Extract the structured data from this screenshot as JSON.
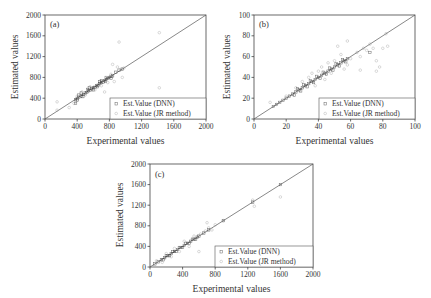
{
  "chart_data": [
    {
      "panel": "(a)",
      "type": "scatter",
      "title": "",
      "xlabel": "Experimental values",
      "ylabel": "Estimated values",
      "xlim": [
        0,
        2000
      ],
      "ylim": [
        0,
        2000
      ],
      "xticks": [
        0,
        400,
        800,
        1200,
        1600,
        2000
      ],
      "yticks": [
        0,
        400,
        800,
        1200,
        1600,
        2000
      ],
      "grid": false,
      "reference_line": "y = x",
      "legend_position": "lower right",
      "series": [
        {
          "name": "Est.Value (DNN)",
          "marker": "open square",
          "color": "#333333",
          "points": [
            [
              380,
              370
            ],
            [
              400,
              390
            ],
            [
              420,
              420
            ],
            [
              450,
              440
            ],
            [
              480,
              470
            ],
            [
              500,
              500
            ],
            [
              520,
              510
            ],
            [
              540,
              540
            ],
            [
              560,
              550
            ],
            [
              580,
              580
            ],
            [
              600,
              600
            ],
            [
              620,
              610
            ],
            [
              640,
              640
            ],
            [
              660,
              650
            ],
            [
              680,
              680
            ],
            [
              700,
              700
            ],
            [
              720,
              710
            ],
            [
              740,
              740
            ],
            [
              760,
              760
            ],
            [
              780,
              780
            ],
            [
              800,
              800
            ],
            [
              820,
              820
            ],
            [
              840,
              830
            ],
            [
              400,
              360
            ],
            [
              450,
              500
            ],
            [
              550,
              600
            ],
            [
              650,
              620
            ],
            [
              700,
              740
            ],
            [
              750,
              720
            ],
            [
              380,
              300
            ],
            [
              420,
              460
            ],
            [
              470,
              430
            ],
            [
              530,
              570
            ],
            [
              600,
              560
            ],
            [
              680,
              720
            ],
            [
              760,
              800
            ],
            [
              820,
              780
            ],
            [
              880,
              900
            ],
            [
              920,
              940
            ],
            [
              960,
              960
            ]
          ]
        },
        {
          "name": "Est.Value (JR method)",
          "marker": "open circle",
          "color": "#999999",
          "points": [
            [
              150,
              330
            ],
            [
              150,
              170
            ],
            [
              300,
              220
            ],
            [
              360,
              300
            ],
            [
              400,
              440
            ],
            [
              460,
              520
            ],
            [
              500,
              460
            ],
            [
              560,
              620
            ],
            [
              620,
              560
            ],
            [
              700,
              640
            ],
            [
              740,
              520
            ],
            [
              780,
              700
            ],
            [
              820,
              860
            ],
            [
              840,
              1050
            ],
            [
              860,
              720
            ],
            [
              900,
              1000
            ],
            [
              920,
              1480
            ],
            [
              940,
              950
            ],
            [
              960,
              800
            ],
            [
              980,
              980
            ],
            [
              1420,
              1660
            ],
            [
              1420,
              600
            ]
          ]
        }
      ]
    },
    {
      "panel": "(b)",
      "type": "scatter",
      "title": "",
      "xlabel": "Experimental values",
      "ylabel": "Estimated values",
      "xlim": [
        0,
        100
      ],
      "ylim": [
        0,
        100
      ],
      "xticks": [
        0,
        20,
        40,
        60,
        80,
        100
      ],
      "yticks": [
        0,
        20,
        40,
        60,
        80,
        100
      ],
      "grid": false,
      "reference_line": "y = x",
      "legend_position": "lower right",
      "series": [
        {
          "name": "Est.Value (DNN)",
          "marker": "open square",
          "color": "#333333",
          "points": [
            [
              12,
              12
            ],
            [
              14,
              14
            ],
            [
              16,
              16
            ],
            [
              18,
              18
            ],
            [
              20,
              20
            ],
            [
              22,
              22
            ],
            [
              24,
              24
            ],
            [
              26,
              26
            ],
            [
              28,
              28
            ],
            [
              30,
              30
            ],
            [
              32,
              32
            ],
            [
              34,
              34
            ],
            [
              36,
              36
            ],
            [
              38,
              38
            ],
            [
              40,
              40
            ],
            [
              42,
              42
            ],
            [
              44,
              44
            ],
            [
              46,
              46
            ],
            [
              48,
              48
            ],
            [
              50,
              50
            ],
            [
              52,
              52
            ],
            [
              54,
              54
            ],
            [
              56,
              56
            ],
            [
              58,
              58
            ],
            [
              25,
              23
            ],
            [
              27,
              29
            ],
            [
              29,
              27
            ],
            [
              31,
              33
            ],
            [
              33,
              31
            ],
            [
              35,
              37
            ],
            [
              37,
              35
            ],
            [
              39,
              41
            ],
            [
              41,
              39
            ],
            [
              43,
              45
            ],
            [
              45,
              43
            ],
            [
              47,
              49
            ],
            [
              49,
              47
            ],
            [
              51,
              53
            ],
            [
              53,
              51
            ],
            [
              55,
              57
            ],
            [
              57,
              55
            ],
            [
              72,
              64
            ]
          ]
        },
        {
          "name": "Est.Value (JR method)",
          "marker": "open circle",
          "color": "#999999",
          "points": [
            [
              10,
              16
            ],
            [
              14,
              14
            ],
            [
              20,
              22
            ],
            [
              26,
              30
            ],
            [
              30,
              36
            ],
            [
              34,
              40
            ],
            [
              36,
              44
            ],
            [
              38,
              32
            ],
            [
              40,
              46
            ],
            [
              42,
              50
            ],
            [
              44,
              38
            ],
            [
              46,
              54
            ],
            [
              48,
              44
            ],
            [
              50,
              56
            ],
            [
              52,
              70
            ],
            [
              54,
              62
            ],
            [
              56,
              48
            ],
            [
              58,
              75
            ],
            [
              58,
              52
            ],
            [
              60,
              58
            ],
            [
              64,
              64
            ],
            [
              66,
              60
            ],
            [
              66,
              47
            ],
            [
              68,
              68
            ],
            [
              70,
              66
            ],
            [
              72,
              72
            ],
            [
              74,
              68
            ],
            [
              76,
              46
            ],
            [
              76,
              56
            ],
            [
              78,
              50
            ],
            [
              80,
              68
            ],
            [
              82,
              82
            ],
            [
              83,
              70
            ]
          ]
        }
      ]
    },
    {
      "panel": "(c)",
      "type": "scatter",
      "title": "",
      "xlabel": "Experimental values",
      "ylabel": "Estimated values",
      "xlim": [
        0,
        2000
      ],
      "ylim": [
        0,
        2000
      ],
      "xticks": [
        0,
        400,
        800,
        1200,
        1600,
        2000
      ],
      "yticks": [
        0,
        400,
        800,
        1200,
        1600,
        2000
      ],
      "grid": false,
      "reference_line": "y = x",
      "legend_position": "lower right",
      "series": [
        {
          "name": "Est.Value (DNN)",
          "marker": "open square",
          "color": "#333333",
          "points": [
            [
              60,
              60
            ],
            [
              100,
              100
            ],
            [
              140,
              140
            ],
            [
              180,
              180
            ],
            [
              220,
              220
            ],
            [
              260,
              260
            ],
            [
              300,
              300
            ],
            [
              340,
              340
            ],
            [
              380,
              380
            ],
            [
              420,
              420
            ],
            [
              460,
              460
            ],
            [
              500,
              500
            ],
            [
              540,
              540
            ],
            [
              580,
              580
            ],
            [
              600,
              600
            ],
            [
              160,
              140
            ],
            [
              200,
              220
            ],
            [
              240,
              220
            ],
            [
              280,
              300
            ],
            [
              320,
              300
            ],
            [
              360,
              380
            ],
            [
              400,
              380
            ],
            [
              440,
              460
            ],
            [
              480,
              460
            ],
            [
              520,
              540
            ],
            [
              560,
              540
            ],
            [
              660,
              660
            ],
            [
              720,
              720
            ],
            [
              900,
              900
            ],
            [
              1260,
              1260
            ],
            [
              1600,
              1600
            ]
          ]
        },
        {
          "name": "Est.Value (JR method)",
          "marker": "open circle",
          "color": "#999999",
          "points": [
            [
              80,
              120
            ],
            [
              150,
              90
            ],
            [
              200,
              260
            ],
            [
              260,
              200
            ],
            [
              300,
              360
            ],
            [
              360,
              300
            ],
            [
              420,
              500
            ],
            [
              480,
              400
            ],
            [
              540,
              600
            ],
            [
              600,
              300
            ],
            [
              620,
              640
            ],
            [
              680,
              700
            ],
            [
              700,
              860
            ],
            [
              720,
              760
            ],
            [
              760,
              720
            ],
            [
              800,
              820
            ],
            [
              900,
              900
            ],
            [
              1260,
              1300
            ],
            [
              1280,
              1180
            ],
            [
              1600,
              1360
            ]
          ]
        }
      ]
    }
  ],
  "panels": [
    {
      "label": "(a)",
      "xlabel": "Experimental values",
      "ylabel": "Estimated values",
      "xtick_labels": [
        "0",
        "400",
        "800",
        "1200",
        "1600",
        "2000"
      ],
      "ytick_labels": [
        "0",
        "400",
        "800",
        "1200",
        "1600",
        "2000"
      ],
      "legend": [
        "Est.Value (DNN)",
        "Est.Value (JR method)"
      ]
    },
    {
      "label": "(b)",
      "xlabel": "Experimental values",
      "ylabel": "Estimated values",
      "xtick_labels": [
        "0",
        "20",
        "40",
        "60",
        "80",
        "100"
      ],
      "ytick_labels": [
        "0",
        "20",
        "40",
        "60",
        "80",
        "100"
      ],
      "legend": [
        "Est.Value (DNN)",
        "Est.Value (JR method)"
      ]
    },
    {
      "label": "(c)",
      "xlabel": "Experimental values",
      "ylabel": "Estimated values",
      "xtick_labels": [
        "0",
        "400",
        "800",
        "1200",
        "1600",
        "2000"
      ],
      "ytick_labels": [
        "0",
        "400",
        "800",
        "1200",
        "1600",
        "2000"
      ],
      "legend": [
        "Est.Value (DNN)",
        "Est.Value (JR method)"
      ]
    }
  ]
}
